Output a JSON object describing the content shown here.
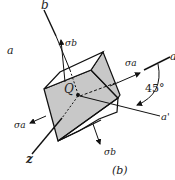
{
  "figure": {
    "caption": "(b)",
    "axes": {
      "b": "b",
      "a": "a",
      "a_right": "a",
      "a_prime": "a'",
      "z": "z"
    },
    "point": "Q",
    "stresses": {
      "sigma_a_right": "σa",
      "sigma_a_left": "σa",
      "sigma_b_up": "σb",
      "sigma_b_down": "σb"
    },
    "angle": "45°"
  },
  "colors": {
    "face_front": "#c8c8c8",
    "line": "#111111",
    "background": "#ffffff"
  }
}
